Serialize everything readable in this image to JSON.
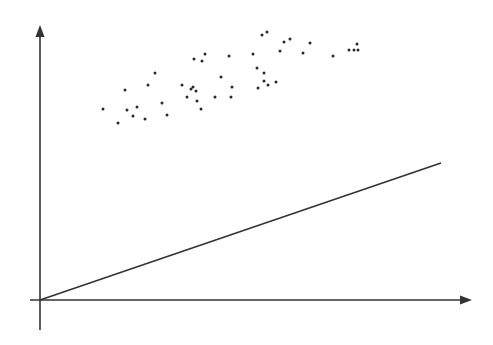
{
  "diagram": {
    "type": "scatter-with-line",
    "colors": {
      "background": "#ffffff",
      "ink": "#333333",
      "dots": "#2a2a2a"
    },
    "axes": {
      "origin": [
        40,
        300
      ],
      "x_axis": {
        "from": [
          30,
          300
        ],
        "to": [
          472,
          300
        ],
        "arrow": true
      },
      "y_axis": {
        "from": [
          40,
          330
        ],
        "to": [
          40,
          25
        ],
        "arrow": true
      },
      "labels": []
    },
    "line": {
      "from": [
        40,
        300
      ],
      "to": [
        441,
        163
      ]
    },
    "points": [
      [
        155,
        73
      ],
      [
        148,
        85
      ],
      [
        125,
        90
      ],
      [
        162,
        103
      ],
      [
        103,
        109
      ],
      [
        127,
        110
      ],
      [
        137,
        107
      ],
      [
        133,
        116
      ],
      [
        145,
        119
      ],
      [
        167,
        115
      ],
      [
        118,
        123
      ],
      [
        205,
        54
      ],
      [
        194,
        59
      ],
      [
        202,
        61
      ],
      [
        229,
        56
      ],
      [
        221,
        77
      ],
      [
        182,
        85
      ],
      [
        193,
        87
      ],
      [
        191,
        89
      ],
      [
        196,
        91
      ],
      [
        232,
        87
      ],
      [
        187,
        97
      ],
      [
        215,
        97
      ],
      [
        231,
        97
      ],
      [
        197,
        101
      ],
      [
        201,
        109
      ],
      [
        262,
        35
      ],
      [
        267,
        32
      ],
      [
        284,
        42
      ],
      [
        290,
        39
      ],
      [
        310,
        43
      ],
      [
        253,
        54
      ],
      [
        280,
        51
      ],
      [
        303,
        53
      ],
      [
        257,
        68
      ],
      [
        264,
        73
      ],
      [
        264,
        81
      ],
      [
        268,
        85
      ],
      [
        276,
        82
      ],
      [
        258,
        88
      ],
      [
        333,
        56
      ],
      [
        349,
        50
      ],
      [
        354,
        50
      ],
      [
        358,
        50
      ],
      [
        357,
        44
      ]
    ]
  }
}
